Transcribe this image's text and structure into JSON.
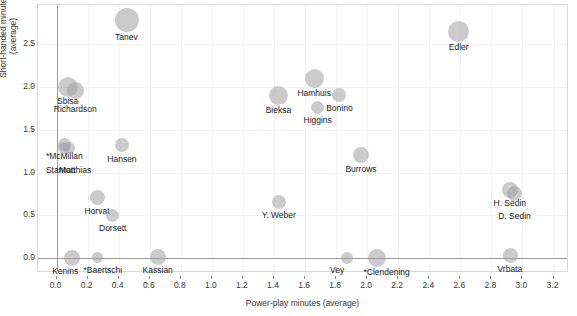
{
  "chart_data": {
    "type": "scatter",
    "title": "",
    "xlabel": "Power-play minutes (average)",
    "ylabel": "Short-handed minutes (average)",
    "xlim": [
      -0.12,
      3.3
    ],
    "ylim": [
      -0.17,
      2.95
    ],
    "xticks": [
      "0.0",
      "0.2",
      "0.4",
      "0.6",
      "0.8",
      "1.0",
      "1.2",
      "1.4",
      "1.6",
      "1.8",
      "2.0",
      "2.2",
      "2.4",
      "2.6",
      "2.8",
      "3.0",
      "3.2"
    ],
    "xtickvals": [
      0.0,
      0.2,
      0.4,
      0.6,
      0.8,
      1.0,
      1.2,
      1.4,
      1.6,
      1.8,
      2.0,
      2.2,
      2.4,
      2.6,
      2.8,
      3.0,
      3.2
    ],
    "yticks": [
      "0.0",
      "0.5",
      "1.0",
      "1.5",
      "2.0",
      "2.5"
    ],
    "ytickvals": [
      0.0,
      0.5,
      1.0,
      1.5,
      2.0,
      2.5
    ],
    "grid": true,
    "legend": "none",
    "size_encoding": "bubble area proportional to total ice time",
    "reference_lines": {
      "x": 0.0,
      "y": 0.0
    },
    "points": [
      {
        "label": "Tanev",
        "x": 0.45,
        "y": 2.78,
        "r": 12.0,
        "lx": 0,
        "ly": 18,
        "anchor": "center"
      },
      {
        "label": "Edler",
        "x": 2.59,
        "y": 2.64,
        "r": 10.5,
        "lx": 0,
        "ly": 16,
        "anchor": "center"
      },
      {
        "label": "Sbisa",
        "x": 0.07,
        "y": 2.0,
        "r": 10.0,
        "lx": 0,
        "ly": 15,
        "anchor": "center"
      },
      {
        "label": "Richardson",
        "x": 0.12,
        "y": 1.95,
        "r": 8.5,
        "lx": 0,
        "ly": 19,
        "anchor": "center"
      },
      {
        "label": "Hamhuis",
        "x": 1.66,
        "y": 2.1,
        "r": 9.5,
        "lx": 0,
        "ly": 15,
        "anchor": "center"
      },
      {
        "label": "Bonino",
        "x": 1.82,
        "y": 1.9,
        "r": 7.0,
        "lx": 0,
        "ly": 13,
        "anchor": "center"
      },
      {
        "label": "Bieksa",
        "x": 1.43,
        "y": 1.9,
        "r": 9.5,
        "lx": 0,
        "ly": 15,
        "anchor": "center"
      },
      {
        "label": "Higgins",
        "x": 1.68,
        "y": 1.76,
        "r": 6.5,
        "lx": 0,
        "ly": 13,
        "anchor": "center"
      },
      {
        "label": "*McMillan",
        "x": 0.05,
        "y": 1.33,
        "r": 6.5,
        "lx": 0,
        "ly": 12,
        "anchor": "center"
      },
      {
        "label": "Stanton",
        "x": 0.05,
        "y": 1.28,
        "r": 6.0,
        "lx": -4,
        "ly": 22,
        "anchor": "center"
      },
      {
        "label": "Matthias",
        "x": 0.08,
        "y": 1.28,
        "r": 6.0,
        "lx": 6,
        "ly": 22,
        "anchor": "center"
      },
      {
        "label": "Hansen",
        "x": 0.42,
        "y": 1.32,
        "r": 7.0,
        "lx": 0,
        "ly": 14,
        "anchor": "center"
      },
      {
        "label": "Burrows",
        "x": 1.96,
        "y": 1.2,
        "r": 8.0,
        "lx": 0,
        "ly": 14,
        "anchor": "center"
      },
      {
        "label": "H. Sedin",
        "x": 2.92,
        "y": 0.8,
        "r": 8.0,
        "lx": 0,
        "ly": 14,
        "anchor": "center"
      },
      {
        "label": "D. Sedin",
        "x": 2.95,
        "y": 0.76,
        "r": 7.5,
        "lx": 0,
        "ly": 23,
        "anchor": "center"
      },
      {
        "label": "Horvat",
        "x": 0.26,
        "y": 0.71,
        "r": 7.5,
        "lx": 0,
        "ly": 14,
        "anchor": "center"
      },
      {
        "label": "Y. Weber",
        "x": 1.43,
        "y": 0.66,
        "r": 7.0,
        "lx": 0,
        "ly": 14,
        "anchor": "center"
      },
      {
        "label": "Dorsett",
        "x": 0.36,
        "y": 0.5,
        "r": 6.5,
        "lx": 0,
        "ly": 13,
        "anchor": "center"
      },
      {
        "label": "Kenins",
        "x": 0.1,
        "y": 0.01,
        "r": 8.0,
        "lx": -7,
        "ly": 14,
        "anchor": "center"
      },
      {
        "label": "*Baertschi",
        "x": 0.26,
        "y": 0.01,
        "r": 5.5,
        "lx": 6,
        "ly": 13,
        "anchor": "center"
      },
      {
        "label": "Kassian",
        "x": 0.65,
        "y": 0.02,
        "r": 8.0,
        "lx": 0,
        "ly": 14,
        "anchor": "center"
      },
      {
        "label": "Vey",
        "x": 1.87,
        "y": 0.01,
        "r": 6.0,
        "lx": -10,
        "ly": 13,
        "anchor": "center"
      },
      {
        "label": "*Clendening",
        "x": 2.06,
        "y": 0.01,
        "r": 9.0,
        "lx": 10,
        "ly": 15,
        "anchor": "center"
      },
      {
        "label": "Vrbata",
        "x": 2.92,
        "y": 0.03,
        "r": 7.5,
        "lx": 0,
        "ly": 14,
        "anchor": "center"
      }
    ]
  }
}
